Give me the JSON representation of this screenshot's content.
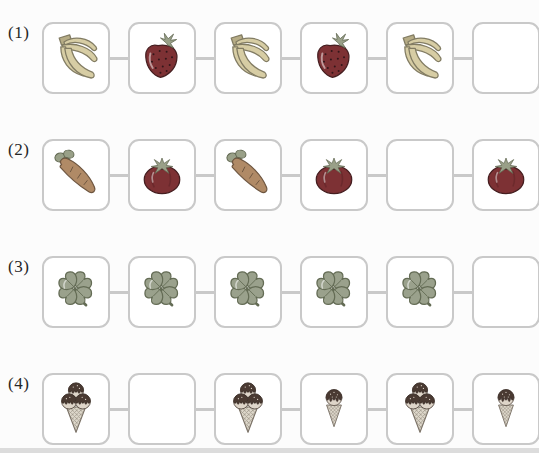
{
  "worksheet": {
    "type": "pattern-sequence-exercise",
    "rows": 4,
    "cells_per_row": 6
  },
  "rows": [
    {
      "label": "(1)",
      "cells": [
        "banana",
        "strawberry",
        "banana",
        "strawberry",
        "banana",
        "empty"
      ]
    },
    {
      "label": "(2)",
      "cells": [
        "carrot",
        "tomato",
        "carrot",
        "tomato",
        "empty",
        "tomato"
      ]
    },
    {
      "label": "(3)",
      "cells": [
        "clover",
        "clover",
        "clover",
        "clover",
        "clover",
        "empty"
      ]
    },
    {
      "label": "(4)",
      "cells": [
        "icecream-triple",
        "empty",
        "icecream-triple",
        "icecream-single",
        "icecream-triple",
        "icecream-single"
      ]
    }
  ],
  "colors": {
    "page_bg": "#fcfcfc",
    "box_border": "#c9c9c9",
    "connector": "#c9c9c9",
    "label_text": "#262626",
    "banana": "#d7cda4",
    "banana_stem": "#b6ac85",
    "banana_line": "#827c63",
    "berry": "#7d3134",
    "berry_line": "#451e20",
    "seed": "#32161a",
    "leaf": "#99a088",
    "leaf_line": "#5f664f",
    "carrot": "#b08a66",
    "carrot_line": "#6e5640",
    "clover": "#9aa18c",
    "clover_line": "#646c55",
    "cream": "#ded5c9",
    "cream_line": "#5d5249",
    "choc": "#4a3a32",
    "choc_line": "#2f2420",
    "cone": "#ded8cb",
    "cone_line": "#a29a8d",
    "cone_edge": "#7b7267",
    "shadow_strip": "#dcdcdc"
  }
}
